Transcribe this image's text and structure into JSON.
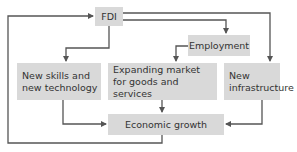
{
  "diagram": {
    "type": "flowchart",
    "colors": {
      "box_fill": "#d9d9d9",
      "text": "#333333",
      "line": "#555555",
      "background": "#ffffff"
    },
    "nodes": {
      "fdi": {
        "label": "FDI"
      },
      "employment": {
        "label": "Employment"
      },
      "skills": {
        "label": "New skills and\nnew technology"
      },
      "market": {
        "label": "Expanding market\nfor goods and services"
      },
      "infrastructure": {
        "label": "New\ninfrastructure"
      },
      "growth": {
        "label": "Economic growth"
      }
    },
    "edges": [
      {
        "from": "FDI",
        "to": "New skills and new technology"
      },
      {
        "from": "FDI",
        "to": "Employment"
      },
      {
        "from": "FDI",
        "to": "New infrastructure"
      },
      {
        "from": "Employment",
        "to": "Expanding market for goods and services"
      },
      {
        "from": "New skills and new technology",
        "to": "Economic growth"
      },
      {
        "from": "Expanding market for goods and services",
        "to": "Economic growth"
      },
      {
        "from": "New infrastructure",
        "to": "Economic growth"
      },
      {
        "from": "Economic growth",
        "to": "FDI"
      }
    ]
  }
}
